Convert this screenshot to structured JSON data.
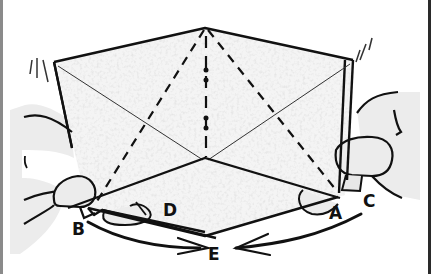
{
  "figure": {
    "labels": {
      "b": "B",
      "d": "D",
      "e": "E",
      "a": "A",
      "c": "C"
    },
    "arrows": [
      {
        "name": "arrow-b-to-center",
        "direction": "right"
      },
      {
        "name": "arrow-a-to-center",
        "direction": "left"
      }
    ],
    "colors": {
      "ink": "#111111",
      "paper": "#f2f2f2",
      "skin": "#ececec",
      "background": "#ffffff"
    }
  }
}
